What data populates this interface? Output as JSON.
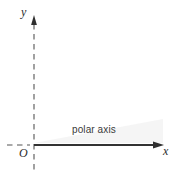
{
  "figure": {
    "kind": "polar-coordinate-axes-diagram",
    "background_color": "#ffffff",
    "labels": {
      "y_axis": "y",
      "x_axis": "x",
      "origin": "O",
      "polar_axis": "polar axis"
    },
    "colors": {
      "axis_line": "#333333",
      "dashed_line": "#555555",
      "text": "#2b2b2b",
      "wedge_shading": "#f2f2f2"
    },
    "geometry": {
      "origin_px": [
        34,
        145
      ],
      "x_axis_end_px": [
        163,
        145
      ],
      "y_axis_top_px": [
        34,
        17
      ],
      "y_axis_bottom_px": [
        34,
        171
      ],
      "x_dashed_left_px": [
        7,
        145
      ]
    }
  }
}
